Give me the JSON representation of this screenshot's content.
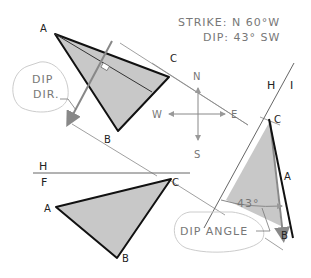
{
  "header": {
    "strike": "STRIKE: N 60°W",
    "dip": "DIP: 43° SW"
  },
  "callouts": {
    "dip_dir_line1": "DIP",
    "dip_dir_line2": "DIR.",
    "dip_angle": "DIP ANGLE",
    "angle_value": "43°"
  },
  "compass": {
    "n": "N",
    "s": "S",
    "e": "E",
    "w": "W"
  },
  "fold_lines": {
    "hf_top": "H",
    "hf_bottom": "F",
    "hi_left": "H",
    "hi_right": "I"
  },
  "top_view": {
    "a": "A",
    "b": "B",
    "c": "C"
  },
  "front_view": {
    "a": "A",
    "b": "B",
    "c": "C"
  },
  "aux_view": {
    "a": "A",
    "b": "B",
    "c": "C"
  },
  "colors": {
    "fill": "#c8c8c8",
    "edge": "#111111",
    "projection": "#777777",
    "arrow": "#888888"
  }
}
